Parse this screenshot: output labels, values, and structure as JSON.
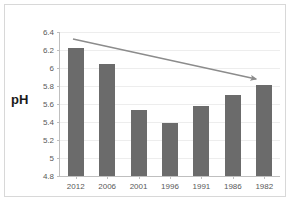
{
  "chart_data": {
    "type": "bar",
    "title": "",
    "xlabel": "",
    "ylabel": "pH",
    "categories": [
      "2012",
      "2006",
      "2001",
      "1996",
      "1991",
      "1986",
      "1982"
    ],
    "values": [
      6.22,
      6.05,
      5.53,
      5.39,
      5.58,
      5.7,
      5.81
    ],
    "ylim": [
      4.8,
      6.4
    ],
    "ytick_labels": [
      "6.4",
      "6.2",
      "6",
      "5.8",
      "5.6",
      "5.4",
      "5.2",
      "5",
      "4.8"
    ],
    "ytick_values": [
      6.4,
      6.2,
      6.0,
      5.8,
      5.6,
      5.4,
      5.2,
      5.0,
      4.8
    ],
    "grid": true,
    "legend": null,
    "annotations": [
      {
        "name": "downward-trend-arrow",
        "type": "arrow",
        "from_category": "2012",
        "to_category": "1982",
        "from_value": 6.25,
        "to_value": 5.86,
        "color": "#8c8c8c"
      }
    ],
    "colors": {
      "bar": "#6b6b6b",
      "gridline": "#ededed",
      "axis": "#bfbfbf",
      "tick_text": "#595959",
      "axis_label": "#1a1a1a",
      "arrow": "#8c8c8c",
      "frame_border": "#d8d8d8",
      "background": "#ffffff"
    }
  }
}
